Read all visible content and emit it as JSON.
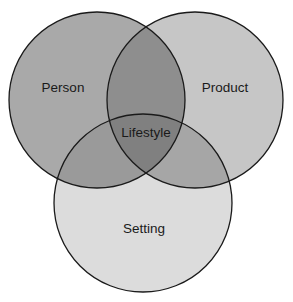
{
  "diagram": {
    "type": "venn",
    "sets": [
      {
        "id": "person",
        "label": "Person",
        "cx": 97,
        "cy": 100,
        "r": 88,
        "color": "#a9a9a9",
        "label_x": 63,
        "label_y": 92
      },
      {
        "id": "product",
        "label": "Product",
        "cx": 195,
        "cy": 100,
        "r": 88,
        "color": "#c6c6c6",
        "label_x": 225,
        "label_y": 92
      },
      {
        "id": "setting",
        "label": "Setting",
        "cx": 143,
        "cy": 203,
        "r": 89,
        "color": "#dcdcdc",
        "label_x": 144,
        "label_y": 233
      }
    ],
    "intersections": {
      "person_product": "#8e8e8e",
      "person_setting": "#9a9a9a",
      "product_setting": "#a6a6a6",
      "all": {
        "label": "Lifestyle",
        "color": "#808080",
        "label_x": 146,
        "label_y": 137
      }
    },
    "stroke_color": "#1a1a1a",
    "background": "#ffffff"
  }
}
